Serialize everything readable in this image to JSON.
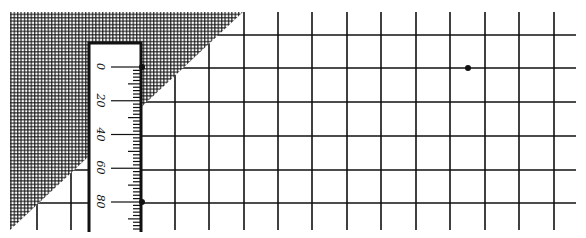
{
  "diagram": {
    "colors": {
      "background": "#ffffff",
      "ink": "#111111"
    },
    "grid": {
      "vertical_lines_x": [
        37,
        71,
        175,
        209,
        244,
        278,
        312,
        347,
        381,
        416,
        450,
        485,
        519,
        554
      ],
      "horizontal_lines_y": [
        35,
        68,
        102,
        136,
        170,
        203
      ],
      "top": 12,
      "bottom": 230,
      "left": 10,
      "right": 576
    },
    "hatched_triangle": {
      "points": [
        [
          10,
          12
        ],
        [
          243,
          12
        ],
        [
          10,
          230
        ]
      ],
      "pattern": "cross-hatch"
    },
    "ruler": {
      "x": 89,
      "y": 43,
      "width": 52,
      "height": 189,
      "labels": [
        {
          "text": "0",
          "y": 67
        },
        {
          "text": "20",
          "y": 101
        },
        {
          "text": "40",
          "y": 135
        },
        {
          "text": "60",
          "y": 168
        },
        {
          "text": "80",
          "y": 202
        }
      ],
      "minor_ticks_per_major": 10
    },
    "points": [
      {
        "name": "ruler-top-point",
        "x": 142,
        "y": 67
      },
      {
        "name": "ruler-bottom-point",
        "x": 142,
        "y": 202
      },
      {
        "name": "grid-point",
        "x": 468,
        "y": 68
      }
    ]
  }
}
